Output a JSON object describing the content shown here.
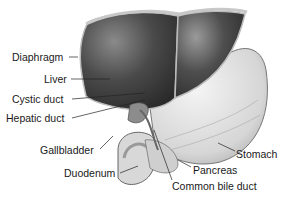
{
  "figure": {
    "labels": {
      "diaphragm": "Diaphragm",
      "liver": "Liver",
      "cystic_duct": "Cystic duct",
      "hepatic_duct": "Hepatic duct",
      "gallbladder": "Gallbladder",
      "duodenum": "Duodenum",
      "stomach": "Stomach",
      "pancreas": "Pancreas",
      "common_bile_duct": "Common bile duct"
    }
  }
}
